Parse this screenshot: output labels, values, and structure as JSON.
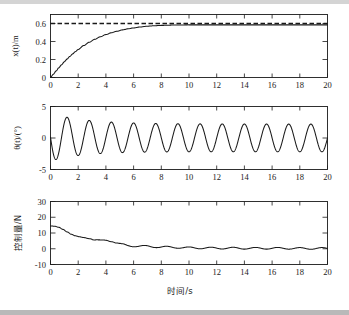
{
  "figure": {
    "title": "",
    "background": "#ffffff",
    "line_color": "#1a1a1a",
    "width": 349,
    "height": 315,
    "xlabel": "时间/s"
  },
  "chart_data": [
    {
      "type": "line",
      "panel": "top",
      "title": "",
      "xlabel": "",
      "ylabel": "x(t)/m",
      "xlim": [
        0,
        20
      ],
      "ylim": [
        0,
        0.7
      ],
      "xticks": [
        0,
        2,
        4,
        6,
        8,
        10,
        12,
        14,
        16,
        18,
        20
      ],
      "xticklabels": [
        "0",
        "2",
        "4",
        "6",
        "8",
        "10",
        "12",
        "14",
        "16",
        "18",
        "20"
      ],
      "yticks": [
        0,
        0.2,
        0.4,
        0.6
      ],
      "yticklabels": [
        "0",
        "0.2",
        "0.4",
        "0.6"
      ],
      "grid": false,
      "legend": null,
      "series": [
        {
          "name": "x(t)",
          "style": "solid",
          "x": [
            0,
            0.2,
            0.4,
            0.6,
            0.8,
            1.0,
            1.2,
            1.4,
            1.6,
            1.8,
            2.0,
            2.4,
            2.8,
            3.2,
            3.6,
            4.0,
            4.4,
            4.8,
            5.2,
            5.6,
            6.0,
            6.5,
            7.0,
            7.5,
            8.0,
            9.0,
            10.0,
            12.0,
            14.0,
            16.0,
            18.0,
            20.0
          ],
          "values": [
            0.0,
            0.035,
            0.072,
            0.108,
            0.142,
            0.175,
            0.206,
            0.235,
            0.262,
            0.288,
            0.312,
            0.355,
            0.392,
            0.425,
            0.453,
            0.477,
            0.497,
            0.514,
            0.529,
            0.541,
            0.551,
            0.562,
            0.57,
            0.575,
            0.579,
            0.583,
            0.585,
            0.585,
            0.585,
            0.585,
            0.585,
            0.585
          ]
        },
        {
          "name": "reference",
          "style": "dashed",
          "x": [
            0,
            20
          ],
          "values": [
            0.6,
            0.6
          ]
        }
      ]
    },
    {
      "type": "line",
      "panel": "middle",
      "title": "",
      "xlabel": "",
      "ylabel": "θ(t)/(°)",
      "xlim": [
        0,
        20
      ],
      "ylim": [
        -5,
        5
      ],
      "xticks": [
        0,
        2,
        4,
        6,
        8,
        10,
        12,
        14,
        16,
        18,
        20
      ],
      "xticklabels": [
        "0",
        "2",
        "4",
        "6",
        "8",
        "10",
        "12",
        "14",
        "16",
        "18",
        "20"
      ],
      "yticks": [
        -5,
        0,
        5
      ],
      "yticklabels": [
        "-5",
        "0",
        "5"
      ],
      "grid": false,
      "legend": null,
      "series": [
        {
          "name": "θ(t)",
          "style": "solid",
          "description": "Damped-start oscillation, period about 1.6 s, first dip to -2.6 deg near t=0.8 s, first peak +3.8 deg near t=1.6 s, amplitude settling to about +/-2.2 deg",
          "period": 1.6,
          "settled_amplitude": 2.2,
          "initial_peak": 3.8,
          "initial_trough": -2.6
        }
      ]
    },
    {
      "type": "line",
      "panel": "bottom",
      "title": "",
      "xlabel": "时间/s",
      "ylabel": "控制量/N",
      "xlim": [
        0,
        20
      ],
      "ylim": [
        -10,
        30
      ],
      "xticks": [
        0,
        2,
        4,
        6,
        8,
        10,
        12,
        14,
        16,
        18,
        20
      ],
      "xticklabels": [
        "0",
        "2",
        "4",
        "6",
        "8",
        "10",
        "12",
        "14",
        "16",
        "18",
        "20"
      ],
      "yticks": [
        -10,
        0,
        10,
        20,
        30
      ],
      "yticklabels": [
        "-10",
        "0",
        "10",
        "20",
        "30"
      ],
      "grid": false,
      "legend": null,
      "series": [
        {
          "name": "control force",
          "style": "solid",
          "x": [
            0,
            0.3,
            0.6,
            0.9,
            1.2,
            1.5,
            1.8,
            2.1,
            2.4,
            2.8,
            3.2,
            3.6,
            4.0,
            4.4,
            4.8,
            5.2,
            5.6,
            6.0,
            6.5,
            7.0,
            7.5,
            8.0,
            9.0,
            10.0,
            11.0,
            12.0,
            13.0,
            14.0,
            15.0,
            16.0,
            17.0,
            18.0,
            19.0,
            20.0
          ],
          "values": [
            14.5,
            14.3,
            13.6,
            12.3,
            10.7,
            9.2,
            8.2,
            7.6,
            7.1,
            6.4,
            5.6,
            5.4,
            5.4,
            4.7,
            3.6,
            2.6,
            2.0,
            1.8,
            1.6,
            1.5,
            1.3,
            1.1,
            0.9,
            0.6,
            0.5,
            0.4,
            0.4,
            0.3,
            0.3,
            0.3,
            0.3,
            0.2,
            0.2,
            0.2
          ]
        }
      ]
    }
  ]
}
